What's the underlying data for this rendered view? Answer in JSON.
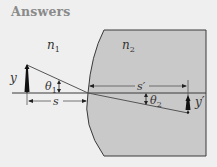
{
  "header": {
    "title": "Answers"
  },
  "diagram": {
    "medium1_label": "n",
    "medium1_sub": "1",
    "medium2_label": "n",
    "medium2_sub": "2",
    "object_label": "y",
    "image_label": "y′",
    "angle1_label": "θ",
    "angle1_sub": "1",
    "angle2_label": "θ",
    "angle2_sub": "2",
    "object_distance_label": "s",
    "image_distance_label": "s′",
    "colors": {
      "background": "#efefef",
      "medium2_fill": "#c9c9c9",
      "line": "#3a3a3a",
      "ray": "#555555"
    }
  }
}
